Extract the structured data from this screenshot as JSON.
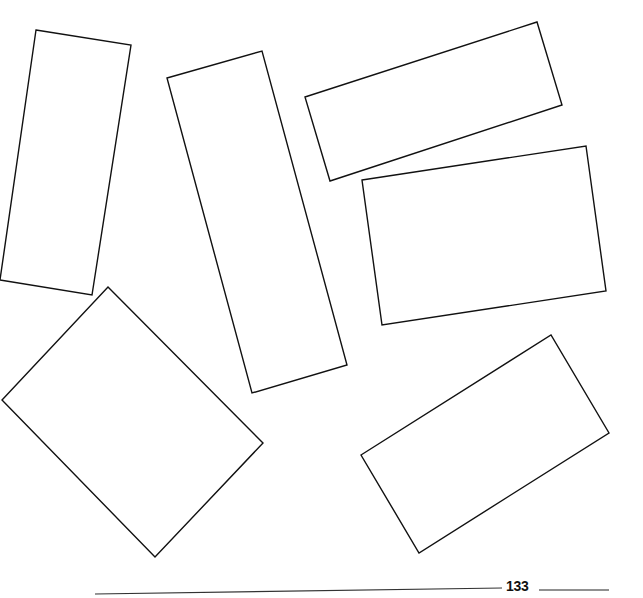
{
  "page": {
    "number": "133",
    "stroke_color": "#111111",
    "background": "#ffffff"
  },
  "shapes": [
    {
      "name": "rectangle-1",
      "points": "36,30 131,45 92,295 0,280"
    },
    {
      "name": "rectangle-2",
      "points": "167,78 262,51 347,365 252,393"
    },
    {
      "name": "rectangle-3",
      "points": "305,97 537,22 562,105 330,181"
    },
    {
      "name": "rectangle-4",
      "points": "362,180 586,146 606,291 382,325"
    },
    {
      "name": "rectangle-5",
      "points": "108,287 263,443 155,557 2,400"
    },
    {
      "name": "rectangle-6",
      "points": "361,455 551,335 609,433 419,553"
    }
  ]
}
